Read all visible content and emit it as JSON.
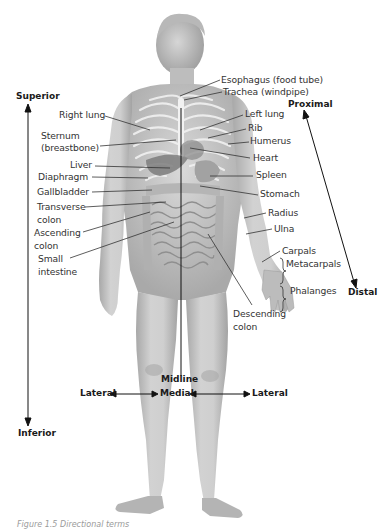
{
  "figure": {
    "caption": "Figure 1.5  Directional terms"
  },
  "directions": {
    "superior": "Superior",
    "inferior": "Inferior",
    "proximal": "Proximal",
    "distal": "Distal",
    "midline": "Midline",
    "medial": "Medial",
    "lateral_left": "Lateral",
    "lateral_right": "Lateral"
  },
  "labels_left": [
    {
      "id": "right-lung",
      "text": "Right lung"
    },
    {
      "id": "sternum",
      "text": "Sternum",
      "text2": "(breastbone)"
    },
    {
      "id": "liver",
      "text": "Liver"
    },
    {
      "id": "diaphragm",
      "text": "Diaphragm"
    },
    {
      "id": "gallbladder",
      "text": "Gallbladder"
    },
    {
      "id": "transverse-colon",
      "text": "Transverse",
      "text2": "colon"
    },
    {
      "id": "ascending-colon",
      "text": "Ascending",
      "text2": "colon"
    },
    {
      "id": "small-intestine",
      "text": "Small",
      "text2": "intestine"
    }
  ],
  "labels_right": [
    {
      "id": "esophagus",
      "text": "Esophagus (food tube)"
    },
    {
      "id": "trachea",
      "text": "Trachea (windpipe)"
    },
    {
      "id": "left-lung",
      "text": "Left lung"
    },
    {
      "id": "rib",
      "text": "Rib"
    },
    {
      "id": "humerus",
      "text": "Humerus"
    },
    {
      "id": "heart",
      "text": "Heart"
    },
    {
      "id": "spleen",
      "text": "Spleen"
    },
    {
      "id": "stomach",
      "text": "Stomach"
    },
    {
      "id": "radius",
      "text": "Radius"
    },
    {
      "id": "ulna",
      "text": "Ulna"
    },
    {
      "id": "carpals",
      "text": "Carpals"
    },
    {
      "id": "metacarpals",
      "text": "Metacarpals"
    },
    {
      "id": "phalanges",
      "text": "Phalanges"
    },
    {
      "id": "descending-colon",
      "text": "Descending",
      "text2": "colon"
    }
  ],
  "colors": {
    "skin": "#c9c9c9",
    "skin_shadow": "#9e9e9e",
    "rib": "#eeeeee",
    "organ": "#8a8a8a",
    "leader_line": "#333333",
    "text": "#333333"
  }
}
